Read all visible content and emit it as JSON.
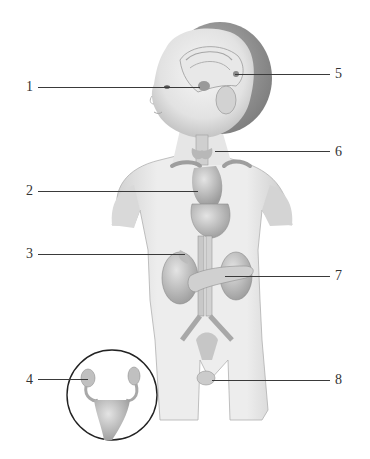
{
  "diagram": {
    "type": "anatomical-labeled-illustration",
    "labels": [
      {
        "id": "1",
        "text": "1",
        "side": "left",
        "x": 28,
        "y": 87,
        "line_from": 38,
        "line_to": 200
      },
      {
        "id": "2",
        "text": "2",
        "side": "left",
        "x": 28,
        "y": 191,
        "line_from": 38,
        "line_to": 198
      },
      {
        "id": "3",
        "text": "3",
        "side": "left",
        "x": 28,
        "y": 254,
        "line_from": 38,
        "line_to": 185
      },
      {
        "id": "4",
        "text": "4",
        "side": "left",
        "x": 28,
        "y": 380,
        "line_from": 38,
        "line_to": 88
      },
      {
        "id": "5",
        "text": "5",
        "side": "right",
        "x": 337,
        "y": 74,
        "line_from": 235,
        "line_to": 330
      },
      {
        "id": "6",
        "text": "6",
        "side": "right",
        "x": 337,
        "y": 152,
        "line_from": 215,
        "line_to": 330
      },
      {
        "id": "7",
        "text": "7",
        "side": "right",
        "x": 337,
        "y": 276,
        "line_from": 225,
        "line_to": 330
      },
      {
        "id": "8",
        "text": "8",
        "side": "right",
        "x": 337,
        "y": 380,
        "line_from": 212,
        "line_to": 330
      }
    ],
    "inset": {
      "shape": "circle",
      "cx": 112,
      "cy": 395,
      "r": 45,
      "content": "female-reproductive-organs"
    },
    "colors": {
      "background": "#ffffff",
      "line": "#3a3a3a",
      "skin_light": "#f0f0f0",
      "skin_mid": "#d8d8d8",
      "skin_dark": "#a8a8a8",
      "hair": "#8a8a8a",
      "organ": "#bdbdbd"
    }
  }
}
